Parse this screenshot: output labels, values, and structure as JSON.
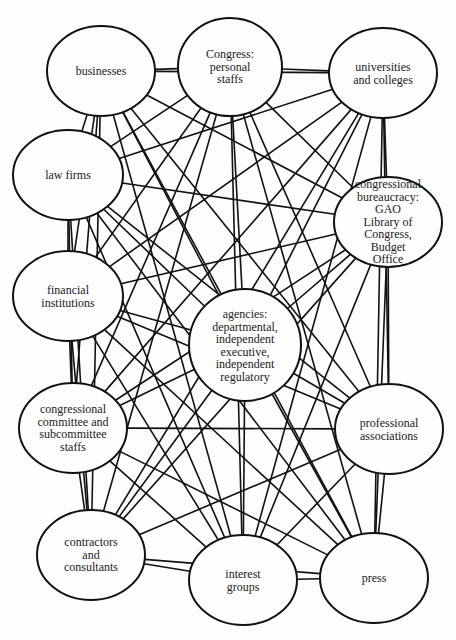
{
  "diagram": {
    "type": "network",
    "background": "#fdfdfd",
    "stroke_color": "#111111",
    "nodes": [
      {
        "id": "businesses",
        "label": "businesses",
        "cx": 101,
        "cy": 71,
        "rx": 54,
        "ry": 45
      },
      {
        "id": "congress-personal-staffs",
        "label": "Congress:\npersonal\nstaffs",
        "cx": 230,
        "cy": 67,
        "rx": 52,
        "ry": 49
      },
      {
        "id": "universities-colleges",
        "label": "universities\nand colleges",
        "cx": 383,
        "cy": 73,
        "rx": 54,
        "ry": 45
      },
      {
        "id": "law-firms",
        "label": "law firms",
        "cx": 68,
        "cy": 175,
        "rx": 55,
        "ry": 45
      },
      {
        "id": "congressional-bureaucracy",
        "label": "congressional\nbureaucracy: GAO\nLibrary of Congress,\nBudget Office",
        "cx": 388,
        "cy": 222,
        "rx": 54,
        "ry": 45
      },
      {
        "id": "financial-institutions",
        "label": "financial\ninstitutions",
        "cx": 68,
        "cy": 296,
        "rx": 55,
        "ry": 45
      },
      {
        "id": "agencies",
        "label": "agencies:\ndepartmental,\nindependent\nexecutive,\nindependent\nregulatory",
        "cx": 245,
        "cy": 345,
        "rx": 56,
        "ry": 56
      },
      {
        "id": "congressional-committee-staffs",
        "label": "congressional\ncommittee and\nsubcommittee\nstaffs",
        "cx": 73,
        "cy": 428,
        "rx": 54,
        "ry": 45
      },
      {
        "id": "professional-associations",
        "label": "professional\nassociations",
        "cx": 389,
        "cy": 429,
        "rx": 54,
        "ry": 45
      },
      {
        "id": "contractors-consultants",
        "label": "contractors\nand\nconsultants",
        "cx": 91,
        "cy": 555,
        "rx": 54,
        "ry": 45
      },
      {
        "id": "interest-groups",
        "label": "interest\ngroups",
        "cx": 243,
        "cy": 580,
        "rx": 54,
        "ry": 45
      },
      {
        "id": "press",
        "label": "press",
        "cx": 374,
        "cy": 578,
        "rx": 54,
        "ry": 45
      }
    ],
    "edges_note": "Every node is connected to every other node (complete graph)."
  }
}
